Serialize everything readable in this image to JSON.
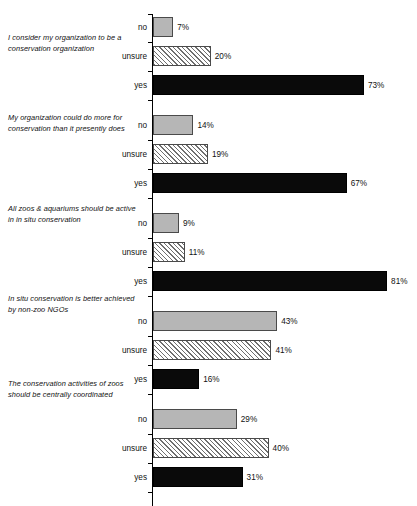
{
  "chart_data": {
    "type": "bar",
    "orientation": "horizontal",
    "title": "",
    "subtitle": "",
    "xlabel": "",
    "ylabel": "",
    "xlim": [
      0,
      90
    ],
    "grid": false,
    "legend": null,
    "value_suffix": "%",
    "categories": [
      "no",
      "unsure",
      "yes"
    ],
    "groups": [
      {
        "question": "I consider my organization to be a conservation organization",
        "values": [
          7,
          20,
          73
        ],
        "labels": [
          "7%",
          "20%",
          "73%"
        ]
      },
      {
        "question": "My organization could do more for conservation than it presently does",
        "values": [
          14,
          19,
          67
        ],
        "labels": [
          "14%",
          "19%",
          "67%"
        ]
      },
      {
        "question": "All zoos & aquariums should be active in in situ conservation",
        "values": [
          9,
          11,
          81
        ],
        "labels": [
          "9%",
          "11%",
          "81%"
        ]
      },
      {
        "question": "In situ conservation is better achieved by non-zoo NGOs",
        "values": [
          43,
          41,
          16
        ],
        "labels": [
          "43%",
          "41%",
          "16%"
        ]
      },
      {
        "question": "The conservation activities of zoos should be centrally coordinated",
        "values": [
          29,
          40,
          31
        ],
        "labels": [
          "29%",
          "40%",
          "31%"
        ]
      }
    ],
    "series_styles": {
      "no": "solid-gray",
      "unsure": "diagonal-hatch",
      "yes": "solid-black"
    },
    "colors": {
      "no": "#b6b6b6",
      "unsure": "#f2f2f2",
      "yes": "#0a0a0a",
      "outline": "#4a4a4a",
      "text": "#111111",
      "axis": "#000000"
    }
  },
  "questions": {
    "q1": "I consider my organization to be a conservation organization",
    "q2": "My organization could do more for conservation than it presently does",
    "q3": "All zoos & aquariums should be active in in situ conservation",
    "q4": "In situ conservation is better achieved by non-zoo NGOs",
    "q5": "The conservation activities of zoos should be centrally coordinated"
  },
  "axis": {
    "cat_no": "no",
    "cat_unsure": "unsure",
    "cat_yes": "yes"
  }
}
